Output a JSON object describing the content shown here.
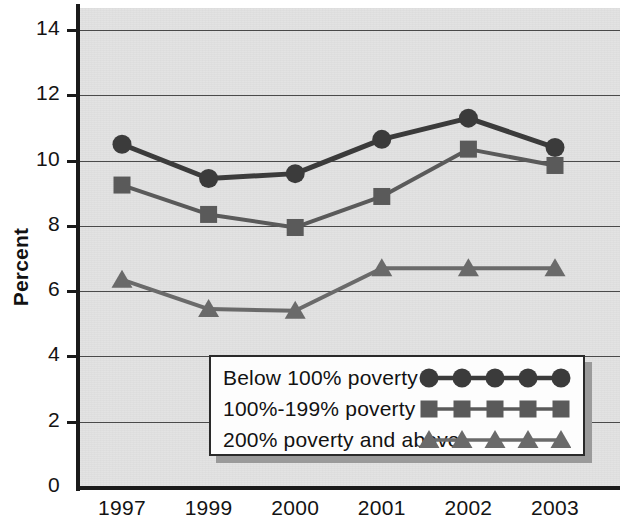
{
  "chart_data": {
    "type": "line",
    "title": "",
    "subtitle": "",
    "xlabel": "",
    "ylabel": "Percent",
    "categories": [
      "1997",
      "1999",
      "2000",
      "2001",
      "2002",
      "2003"
    ],
    "ylim": [
      0,
      14
    ],
    "ytick_values": [
      0,
      2,
      4,
      6,
      8,
      10,
      12,
      14
    ],
    "ytick_labels": [
      "0",
      "2",
      "4",
      "6",
      "8",
      "10",
      "12",
      "14"
    ],
    "grid": true,
    "legend_position": "lower-center",
    "series": [
      {
        "name": "Below 100% poverty",
        "marker": "circle",
        "color": "#3b3b3b",
        "values": [
          10.5,
          9.45,
          9.6,
          10.65,
          11.3,
          10.4
        ]
      },
      {
        "name": "100%-199% poverty",
        "marker": "square",
        "color": "#5a5a5a",
        "values": [
          9.25,
          8.35,
          7.95,
          8.9,
          10.35,
          9.85
        ]
      },
      {
        "name": "200% poverty and above",
        "marker": "triangle",
        "color": "#6a6a6a",
        "values": [
          6.35,
          5.45,
          5.4,
          6.7,
          6.7,
          6.7
        ]
      }
    ]
  },
  "legend": {
    "items": [
      {
        "label": "Below 100% poverty",
        "marker": "circle-marker"
      },
      {
        "label": "100%-199% poverty",
        "marker": "square-marker"
      },
      {
        "label": "200% poverty and above",
        "marker": "triangle-marker"
      }
    ]
  },
  "colors": {
    "plot_background": "#e2e2e2",
    "axis": "#1a1a1a",
    "gridline": "#4a4a4a",
    "legend_background": "#fdfdfd",
    "legend_shadow": "#9a9a9a",
    "series_1": "#3b3b3b",
    "series_2": "#5a5a5a",
    "series_3": "#6a6a6a"
  }
}
